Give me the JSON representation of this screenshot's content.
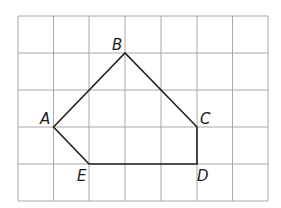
{
  "diagram": {
    "type": "polygon-on-grid",
    "grid": {
      "columns": 7,
      "rows": 5,
      "origin_x": 18,
      "origin_y": 16,
      "cell_w": 35.7,
      "cell_h": 37,
      "line_color": "#a8a8a8"
    },
    "polygon": {
      "name": "ABCDE",
      "stroke_color": "#222222",
      "vertices": [
        {
          "label": "A",
          "gx": 1,
          "gy": 3
        },
        {
          "label": "B",
          "gx": 3,
          "gy": 1
        },
        {
          "label": "C",
          "gx": 5,
          "gy": 3
        },
        {
          "label": "D",
          "gx": 5,
          "gy": 4
        },
        {
          "label": "E",
          "gx": 2,
          "gy": 4
        }
      ]
    },
    "labels": {
      "A": "A",
      "B": "B",
      "C": "C",
      "D": "D",
      "E": "E"
    }
  }
}
